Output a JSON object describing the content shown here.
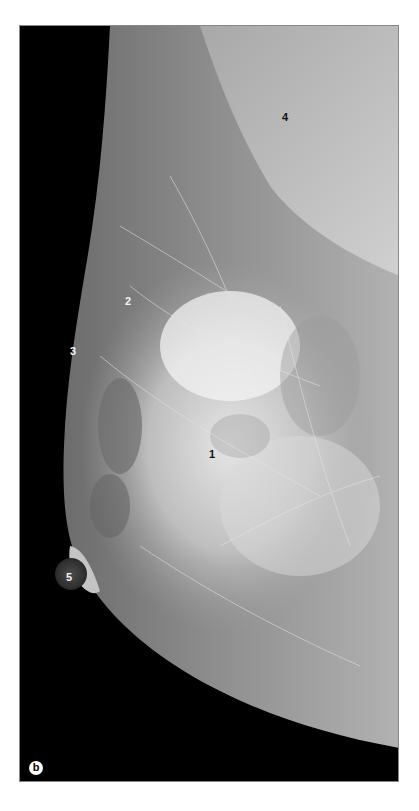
{
  "figure": {
    "panel_label": "b",
    "annotations": [
      {
        "id": "1",
        "text": "1",
        "x": 209,
        "y": 449,
        "style": "dark"
      },
      {
        "id": "2",
        "text": "2",
        "x": 125,
        "y": 296,
        "style": "light"
      },
      {
        "id": "3",
        "text": "3",
        "x": 70,
        "y": 346,
        "style": "light"
      },
      {
        "id": "4",
        "text": "4",
        "x": 282,
        "y": 112,
        "style": "dark"
      },
      {
        "id": "5",
        "text": "5",
        "x": 66,
        "y": 572,
        "style": "light"
      }
    ]
  },
  "colors": {
    "background": "#000000",
    "page": "#ffffff",
    "tissue_dark": "#6a6a6a",
    "tissue_light": "#e8e8e8"
  }
}
